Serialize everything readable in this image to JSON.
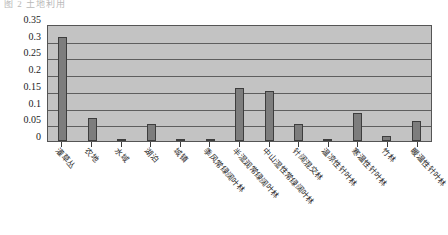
{
  "header": {
    "clipped_text": "图 2  土地利用"
  },
  "chart_data": {
    "type": "bar",
    "title": "",
    "subtitle": "",
    "xlabel": "",
    "ylabel": "",
    "ylim": [
      0,
      0.35
    ],
    "grid": true,
    "legend": "none",
    "ytick_labels": [
      "0.35",
      "0.3",
      "0.25",
      "0.2",
      "0.15",
      "0.1",
      "0.05",
      "0"
    ],
    "ytick_values": [
      0.35,
      0.3,
      0.25,
      0.2,
      0.15,
      0.1,
      0.05,
      0
    ],
    "categories": [
      "灌草丛",
      "农地",
      "水域",
      "湖泊",
      "城镇",
      "季风常绿阔叶林",
      "半湿润常绿阔叶林",
      "中山湿性常绿阔叶林",
      "针阔混交林",
      "温凉性针叶林",
      "寒温性针叶林",
      "竹林",
      "暖温性针叶林"
    ],
    "values": [
      0.31,
      0.07,
      0.005,
      0.05,
      0.003,
      0.002,
      0.16,
      0.15,
      0.05,
      0.003,
      0.085,
      0.015,
      0.06
    ],
    "colors": {
      "bar_fill": "#7d7d7d",
      "bar_border": "#3d3d3d",
      "plot_background": "#c3c3c3",
      "gridline": "#5e5e5e",
      "axis": "#555555",
      "text": "#1a1a1a"
    }
  }
}
